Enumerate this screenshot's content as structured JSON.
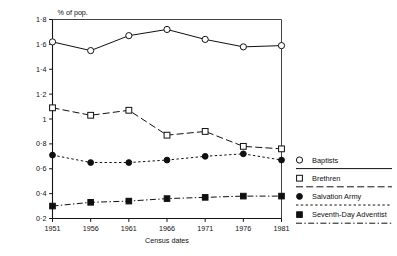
{
  "chart_data": {
    "type": "line",
    "title": "",
    "subtitle": "",
    "unit_label": "% of pop.",
    "xlabel": "Census dates",
    "ylabel": "",
    "categories": [
      "1951",
      "1956",
      "1961",
      "1966",
      "1971",
      "1976",
      "1981"
    ],
    "x": [
      1951,
      1956,
      1961,
      1966,
      1971,
      1976,
      1981
    ],
    "xlim": [
      1951,
      1981
    ],
    "ylim": [
      0.2,
      1.8
    ],
    "y_ticks": [
      0.2,
      0.4,
      0.6,
      0.8,
      1.0,
      1.2,
      1.4,
      1.6,
      1.8
    ],
    "y_tick_labels": [
      "0·2",
      "0·4",
      "0·6",
      "0·8",
      "1",
      "1·2",
      "1·4",
      "1·6",
      "1·8"
    ],
    "x_tick_labels": [
      "1951",
      "1956",
      "1961",
      "1966",
      "1971",
      "1976",
      "1981"
    ],
    "grid": false,
    "legend_position": "right",
    "series": [
      {
        "name": "Baptists",
        "marker": "open-circle",
        "linestyle": "solid",
        "values": [
          1.62,
          1.55,
          1.67,
          1.72,
          1.64,
          1.58,
          1.59
        ]
      },
      {
        "name": "Brethren",
        "marker": "open-square",
        "linestyle": "dashed",
        "values": [
          1.09,
          1.03,
          1.07,
          0.87,
          0.9,
          0.78,
          0.76
        ]
      },
      {
        "name": "Salvation Army",
        "marker": "filled-circle",
        "linestyle": "dotted",
        "values": [
          0.71,
          0.65,
          0.65,
          0.67,
          0.7,
          0.72,
          0.67
        ]
      },
      {
        "name": "Seventh-Day Adventist",
        "marker": "filled-square",
        "linestyle": "dashdot",
        "values": [
          0.3,
          0.33,
          0.34,
          0.36,
          0.37,
          0.38,
          0.38
        ]
      }
    ]
  },
  "legend": {
    "items": [
      {
        "label": "Baptists",
        "marker": "open-circle",
        "linestyle": "solid"
      },
      {
        "label": "Brethren",
        "marker": "open-square",
        "linestyle": "dashed"
      },
      {
        "label": "Salvation Army",
        "marker": "filled-circle",
        "linestyle": "dotted"
      },
      {
        "label": "Seventh-Day Adventist",
        "marker": "filled-square",
        "linestyle": "dashdot"
      }
    ]
  },
  "colors": {
    "ink": "#101010",
    "background": "#ffffff"
  }
}
